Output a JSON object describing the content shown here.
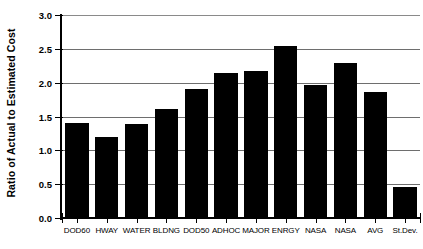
{
  "chart_data": {
    "type": "bar",
    "title": "",
    "xlabel": "",
    "ylabel": "Ratio of Actual to Estimated Cost",
    "ylim": [
      0.0,
      3.0
    ],
    "ytick_labels": [
      "0.0",
      "0.5",
      "1.0",
      "1.5",
      "2.0",
      "2.5",
      "3.0"
    ],
    "ytick_values": [
      0.0,
      0.5,
      1.0,
      1.5,
      2.0,
      2.5,
      3.0
    ],
    "grid": "horizontal",
    "legend": "none",
    "bar_color": "#000000",
    "categories": [
      "DOD60",
      "HWAY",
      "WATER",
      "BLDNG",
      "DOD50",
      "ADHOC",
      "MAJOR",
      "ENRGY",
      "NASA",
      "NASA",
      "AVG",
      "St.Dev."
    ],
    "values": [
      1.41,
      1.2,
      1.39,
      1.61,
      1.9,
      2.15,
      2.18,
      2.54,
      1.96,
      2.29,
      1.86,
      0.46
    ]
  },
  "axes": {
    "y_title": "Ratio of Actual to Estimated Cost"
  }
}
